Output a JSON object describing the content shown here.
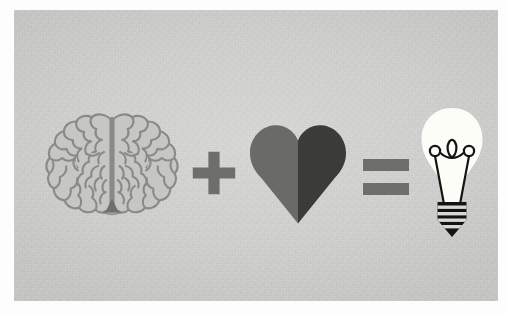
{
  "poster": {
    "title": "Brain plus Heart equals Idea",
    "description": "Flat illustration equation on a textured light gray card: a brain icon plus a two-tone heart icon equals a glowing light bulb icon.",
    "paper_color": "#fdfdfd",
    "canvas_color": "#d3d3d2"
  },
  "equation": {
    "expression": "brain + heart = idea",
    "items": [
      {
        "id": "brain",
        "role": "operand",
        "icon": "brain-icon",
        "label": "Brain",
        "meaning": "Intellect",
        "fill_color": "#c6c6c5",
        "outline_color": "#8a8a89",
        "stem_color": "#6f6f6e"
      },
      {
        "id": "plus",
        "role": "operator",
        "icon": "plus-icon",
        "label": "+",
        "meaning": "Plus",
        "fill_color": "#6e6e6d"
      },
      {
        "id": "heart",
        "role": "operand",
        "icon": "heart-icon",
        "label": "Heart",
        "meaning": "Passion",
        "left_half_color": "#6a6a69",
        "right_half_color": "#3b3b3a"
      },
      {
        "id": "equals",
        "role": "operator",
        "icon": "equals-icon",
        "label": "=",
        "meaning": "Equals",
        "fill_color": "#6e6e6d"
      },
      {
        "id": "bulb",
        "role": "result",
        "icon": "lightbulb-icon",
        "label": "Light bulb",
        "meaning": "Idea",
        "glass_color": "#fdfdf8",
        "filament_color": "#141414",
        "base_color": "#141414",
        "base_stripe_color": "#d8d8d4",
        "base_stripe_count": 4,
        "filament_loop_count": 3
      }
    ]
  }
}
